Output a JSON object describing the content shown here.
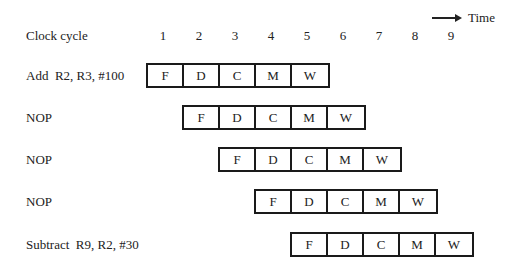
{
  "header": {
    "clock_label": "Clock cycle",
    "time_label": "Time",
    "cycles": [
      "1",
      "2",
      "3",
      "4",
      "5",
      "6",
      "7",
      "8",
      "9"
    ]
  },
  "instructions": [
    {
      "label": "Add  R2, R3, #100",
      "start_cycle": 1,
      "stages": [
        "F",
        "D",
        "C",
        "M",
        "W"
      ]
    },
    {
      "label": "NOP",
      "start_cycle": 2,
      "stages": [
        "F",
        "D",
        "C",
        "M",
        "W"
      ]
    },
    {
      "label": "NOP",
      "start_cycle": 3,
      "stages": [
        "F",
        "D",
        "C",
        "M",
        "W"
      ]
    },
    {
      "label": "NOP",
      "start_cycle": 4,
      "stages": [
        "F",
        "D",
        "C",
        "M",
        "W"
      ]
    },
    {
      "label": "Subtract  R9, R2, #30",
      "start_cycle": 5,
      "stages": [
        "F",
        "D",
        "C",
        "M",
        "W"
      ]
    }
  ]
}
